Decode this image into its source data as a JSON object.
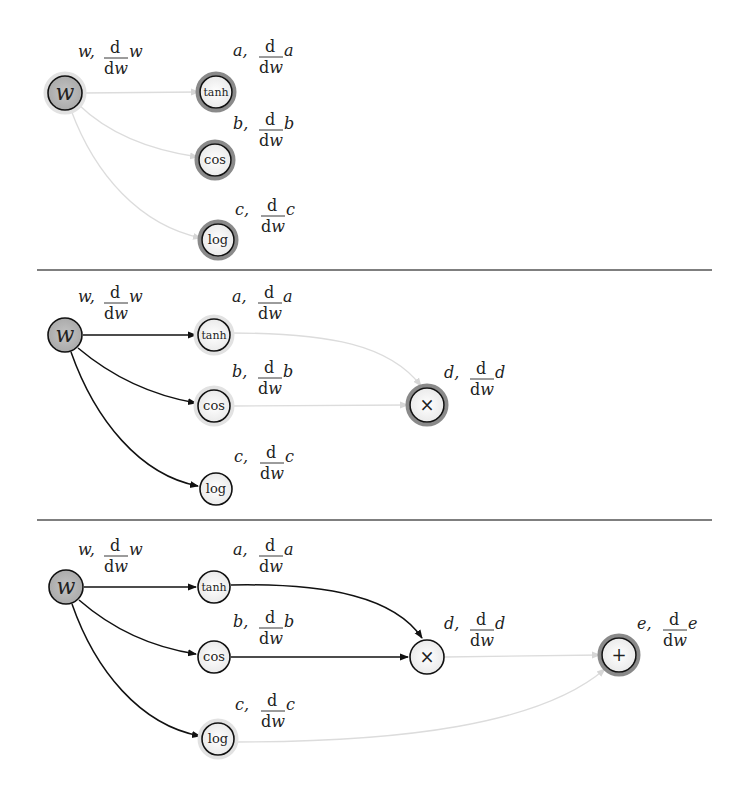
{
  "diagram": {
    "colors": {
      "edge_active": "#111111",
      "edge_inactive": "#dcdcdc",
      "node_input_fill": "#b5b5b5",
      "node_fill": "#f4f4f4",
      "node_stroke": "#111111",
      "halo_active": "#8a8a8a",
      "halo_inactive": "#e2e2e2",
      "separator": "#555555"
    },
    "separators": [
      {
        "x1": 37,
        "x2": 712,
        "y": 270
      },
      {
        "x1": 37,
        "x2": 712,
        "y": 520
      }
    ],
    "panels": [
      {
        "id": "panel-1",
        "nodes": [
          {
            "id": "w",
            "glyph": "w",
            "italic": true,
            "x": 65,
            "y": 93,
            "r": 17,
            "input": true,
            "halo": "inactive",
            "var": "w",
            "label_x": 78,
            "label_y": 57
          },
          {
            "id": "tanh",
            "glyph": "tanh",
            "italic": false,
            "x": 216,
            "y": 92,
            "r": 16,
            "input": false,
            "halo": "active",
            "var": "a",
            "label_x": 233,
            "label_y": 56
          },
          {
            "id": "cos",
            "glyph": "cos",
            "italic": false,
            "x": 215,
            "y": 160,
            "r": 16,
            "input": false,
            "halo": "active",
            "var": "b",
            "label_x": 233,
            "label_y": 129
          },
          {
            "id": "log",
            "glyph": "log",
            "italic": false,
            "x": 218,
            "y": 240,
            "r": 16,
            "input": false,
            "halo": "active",
            "var": "c",
            "label_x": 235,
            "label_y": 215
          }
        ],
        "edges": [
          {
            "from": "w",
            "to": "tanh",
            "state": "inactive",
            "path": "M83,93 L199,92"
          },
          {
            "from": "w",
            "to": "cos",
            "state": "inactive",
            "path": "M79,105 C110,135 150,150 198,157"
          },
          {
            "from": "w",
            "to": "log",
            "state": "inactive",
            "path": "M71,110 C95,175 140,225 201,238"
          }
        ]
      },
      {
        "id": "panel-2",
        "nodes": [
          {
            "id": "w",
            "glyph": "w",
            "italic": true,
            "x": 65,
            "y": 335,
            "r": 17,
            "input": true,
            "halo": "none",
            "var": "w",
            "label_x": 78,
            "label_y": 302
          },
          {
            "id": "tanh",
            "glyph": "tanh",
            "italic": false,
            "x": 214,
            "y": 335,
            "r": 16,
            "input": false,
            "halo": "inactive",
            "var": "a",
            "label_x": 232,
            "label_y": 302
          },
          {
            "id": "cos",
            "glyph": "cos",
            "italic": false,
            "x": 214,
            "y": 406,
            "r": 16,
            "input": false,
            "halo": "inactive",
            "var": "b",
            "label_x": 232,
            "label_y": 377
          },
          {
            "id": "log",
            "glyph": "log",
            "italic": false,
            "x": 216,
            "y": 489,
            "r": 16,
            "input": false,
            "halo": "none",
            "var": "c",
            "label_x": 234,
            "label_y": 462
          },
          {
            "id": "mul",
            "glyph": "×",
            "italic": false,
            "x": 427,
            "y": 405,
            "r": 17,
            "input": false,
            "halo": "active",
            "var": "d",
            "label_x": 444,
            "label_y": 378
          }
        ],
        "edges": [
          {
            "from": "w",
            "to": "tanh",
            "state": "active",
            "path": "M83,335 L196,335"
          },
          {
            "from": "w",
            "to": "cos",
            "state": "active",
            "path": "M78,348 C110,375 150,395 196,403"
          },
          {
            "from": "w",
            "to": "log",
            "state": "active",
            "path": "M71,352 C95,420 140,475 198,486"
          },
          {
            "from": "tanh",
            "to": "mul",
            "state": "inactive",
            "path": "M231,333 C330,333 390,345 421,386"
          },
          {
            "from": "cos",
            "to": "mul",
            "state": "inactive",
            "path": "M231,406 L408,405"
          }
        ]
      },
      {
        "id": "panel-3",
        "nodes": [
          {
            "id": "w",
            "glyph": "w",
            "italic": true,
            "x": 66,
            "y": 587,
            "r": 17,
            "input": true,
            "halo": "none",
            "var": "w",
            "label_x": 78,
            "label_y": 555
          },
          {
            "id": "tanh",
            "glyph": "tanh",
            "italic": false,
            "x": 214,
            "y": 587,
            "r": 16,
            "input": false,
            "halo": "none",
            "var": "a",
            "label_x": 233,
            "label_y": 555
          },
          {
            "id": "cos",
            "glyph": "cos",
            "italic": false,
            "x": 214,
            "y": 657,
            "r": 16,
            "input": false,
            "halo": "none",
            "var": "b",
            "label_x": 233,
            "label_y": 627
          },
          {
            "id": "log",
            "glyph": "log",
            "italic": false,
            "x": 218,
            "y": 739,
            "r": 16,
            "input": false,
            "halo": "inactive",
            "var": "c",
            "label_x": 235,
            "label_y": 710
          },
          {
            "id": "mul",
            "glyph": "×",
            "italic": false,
            "x": 427,
            "y": 657,
            "r": 17,
            "input": false,
            "halo": "none",
            "var": "d",
            "label_x": 444,
            "label_y": 629
          },
          {
            "id": "add",
            "glyph": "+",
            "italic": false,
            "x": 619,
            "y": 655,
            "r": 17,
            "input": false,
            "halo": "active",
            "var": "e",
            "label_x": 637,
            "label_y": 629
          }
        ],
        "edges": [
          {
            "from": "w",
            "to": "tanh",
            "state": "active",
            "path": "M84,587 L196,587"
          },
          {
            "from": "w",
            "to": "cos",
            "state": "active",
            "path": "M79,600 C110,627 150,647 196,654"
          },
          {
            "from": "w",
            "to": "log",
            "state": "active",
            "path": "M72,604 C95,670 140,725 200,736"
          },
          {
            "from": "tanh",
            "to": "mul",
            "state": "active",
            "path": "M231,585 C330,583 395,598 422,638"
          },
          {
            "from": "cos",
            "to": "mul",
            "state": "active",
            "path": "M231,657 L408,657"
          },
          {
            "from": "mul",
            "to": "add",
            "state": "inactive",
            "path": "M445,657 L600,655"
          },
          {
            "from": "log",
            "to": "add",
            "state": "inactive",
            "path": "M235,742 C400,742 540,725 605,669"
          }
        ]
      }
    ],
    "labels": {
      "derivative_numerator": "d",
      "derivative_denominator": "dw",
      "separator_char": ","
    }
  }
}
